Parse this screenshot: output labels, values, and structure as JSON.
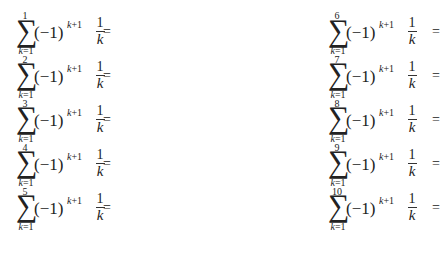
{
  "expression": {
    "sum_symbol": "∑",
    "lower_bound": "k=1",
    "summand_base": "(−1)",
    "exponent": "k+1",
    "numerator": "1",
    "denominator": "k",
    "relation": "="
  },
  "left_column": {
    "rows": [
      {
        "upper": "1"
      },
      {
        "upper": "2"
      },
      {
        "upper": "3"
      },
      {
        "upper": "4"
      },
      {
        "upper": "5"
      }
    ]
  },
  "right_column": {
    "rows": [
      {
        "upper": "6"
      },
      {
        "upper": "7"
      },
      {
        "upper": "8"
      },
      {
        "upper": "9"
      },
      {
        "upper": "10"
      }
    ]
  }
}
